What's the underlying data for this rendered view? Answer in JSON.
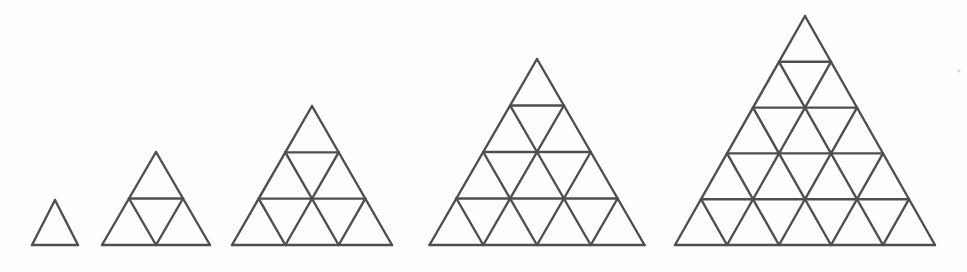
{
  "figure": {
    "background_color": "#fefefe",
    "line_color": "#4f4f4f",
    "line_width": 2.4,
    "canvas": {
      "width": 967,
      "height": 272
    },
    "baseline_y": 245,
    "items": [
      {
        "name": "triangle-1",
        "rows": 1,
        "small_triangle_count": 1,
        "upward_count": 1,
        "downward_count": 0,
        "left_x": 32,
        "right_x": 78,
        "base_width": 46,
        "apex_x": 55,
        "apex_y": 200,
        "height": 45
      },
      {
        "name": "triangle-2",
        "rows": 2,
        "small_triangle_count": 4,
        "upward_count": 3,
        "downward_count": 1,
        "left_x": 102,
        "right_x": 210,
        "base_width": 108,
        "apex_x": 156,
        "apex_y": 152,
        "height": 93
      },
      {
        "name": "triangle-3",
        "rows": 3,
        "small_triangle_count": 9,
        "upward_count": 6,
        "downward_count": 3,
        "left_x": 232,
        "right_x": 392,
        "base_width": 160,
        "apex_x": 312,
        "apex_y": 106,
        "height": 139
      },
      {
        "name": "triangle-4",
        "rows": 4,
        "small_triangle_count": 16,
        "upward_count": 10,
        "downward_count": 6,
        "left_x": 430,
        "right_x": 645,
        "base_width": 215,
        "apex_x": 537,
        "apex_y": 59,
        "height": 186
      },
      {
        "name": "triangle-5",
        "rows": 5,
        "small_triangle_count": 25,
        "upward_count": 15,
        "downward_count": 10,
        "left_x": 675,
        "right_x": 935,
        "base_width": 260,
        "apex_x": 805,
        "apex_y": 16,
        "height": 229
      }
    ],
    "specks": [
      {
        "x": 959,
        "y": 71,
        "r": 1.6
      }
    ]
  }
}
